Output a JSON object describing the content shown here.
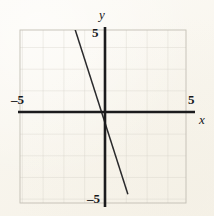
{
  "figure": {
    "background_color": "#fbf9f3",
    "axis_color": "#1b1b1d",
    "grid_color": "#c9c6bc",
    "line_color": "#2a2a2c"
  },
  "labels": {
    "y_axis_name": "y",
    "x_axis_name": "x",
    "y_max": "5",
    "y_min": "–5",
    "x_min": "–5",
    "x_max": "5"
  },
  "chart_data": {
    "type": "line",
    "title": "",
    "xlabel": "x",
    "ylabel": "y",
    "xlim": [
      -5,
      5
    ],
    "ylim": [
      -5,
      5
    ],
    "xticks": [
      -5,
      5
    ],
    "yticks": [
      -5,
      5
    ],
    "xtick_labels": [
      "–5",
      "5"
    ],
    "ytick_labels": [
      "–5",
      "5"
    ],
    "grid": true,
    "grid_step": 1,
    "legend": null,
    "series": [
      {
        "name": "line",
        "equation": "y = -3x - 0.5",
        "slope": -3,
        "intercept": -0.5,
        "x": [
          -1.7,
          1.1
        ],
        "values": [
          4.6,
          -3.8
        ],
        "endpoints": [
          [
            -1.7,
            4.6
          ],
          [
            1.1,
            -3.8
          ]
        ]
      }
    ]
  }
}
